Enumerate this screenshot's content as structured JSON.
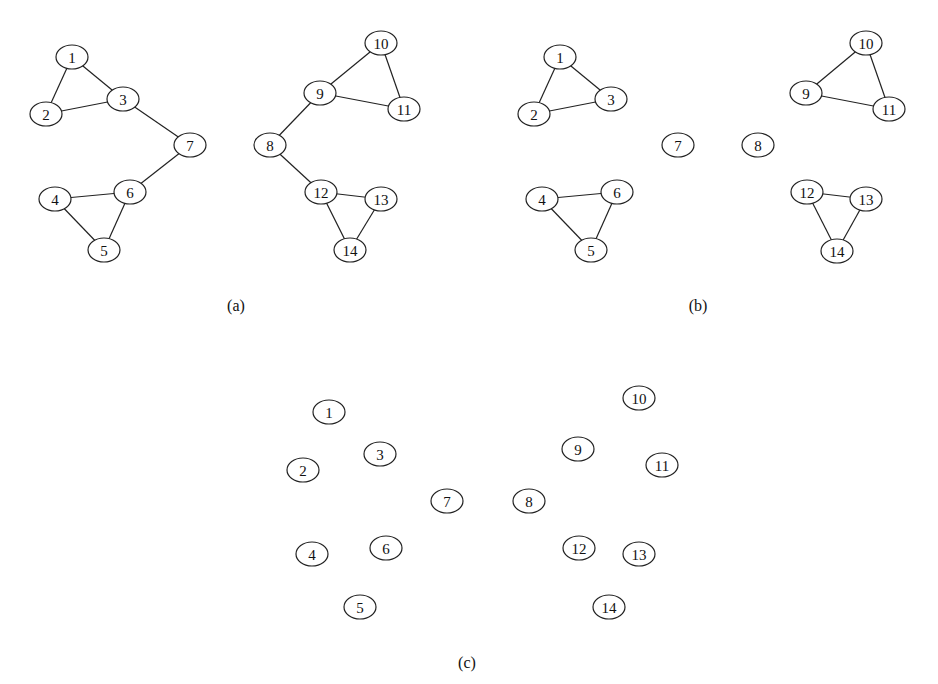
{
  "figure": {
    "node_style": {
      "rx": 16,
      "ry": 12,
      "stroke": "#222222",
      "fill": "#ffffff"
    },
    "panels": [
      {
        "label": "(a)",
        "label_pos": [
          236,
          305
        ],
        "nodes": [
          {
            "id": "1",
            "x": 72,
            "y": 57
          },
          {
            "id": "2",
            "x": 46,
            "y": 114
          },
          {
            "id": "3",
            "x": 123,
            "y": 99
          },
          {
            "id": "4",
            "x": 55,
            "y": 199
          },
          {
            "id": "5",
            "x": 104,
            "y": 250
          },
          {
            "id": "6",
            "x": 130,
            "y": 192
          },
          {
            "id": "7",
            "x": 190,
            "y": 145
          },
          {
            "id": "8",
            "x": 270,
            "y": 145
          },
          {
            "id": "9",
            "x": 320,
            "y": 93
          },
          {
            "id": "10",
            "x": 381,
            "y": 43
          },
          {
            "id": "11",
            "x": 404,
            "y": 109
          },
          {
            "id": "12",
            "x": 321,
            "y": 192
          },
          {
            "id": "13",
            "x": 381,
            "y": 199
          },
          {
            "id": "14",
            "x": 350,
            "y": 250
          }
        ],
        "edges": [
          [
            "1",
            "2"
          ],
          [
            "1",
            "3"
          ],
          [
            "2",
            "3"
          ],
          [
            "3",
            "7"
          ],
          [
            "7",
            "6"
          ],
          [
            "4",
            "6"
          ],
          [
            "4",
            "5"
          ],
          [
            "5",
            "6"
          ],
          [
            "8",
            "9"
          ],
          [
            "9",
            "10"
          ],
          [
            "9",
            "11"
          ],
          [
            "10",
            "11"
          ],
          [
            "8",
            "12"
          ],
          [
            "12",
            "13"
          ],
          [
            "12",
            "14"
          ],
          [
            "13",
            "14"
          ]
        ]
      },
      {
        "label": "(b)",
        "label_pos": [
          698,
          305
        ],
        "nodes": [
          {
            "id": "1",
            "x": 560,
            "y": 57
          },
          {
            "id": "2",
            "x": 534,
            "y": 114
          },
          {
            "id": "3",
            "x": 611,
            "y": 99
          },
          {
            "id": "4",
            "x": 542,
            "y": 199
          },
          {
            "id": "5",
            "x": 591,
            "y": 250
          },
          {
            "id": "6",
            "x": 617,
            "y": 192
          },
          {
            "id": "7",
            "x": 678,
            "y": 145
          },
          {
            "id": "8",
            "x": 758,
            "y": 145
          },
          {
            "id": "9",
            "x": 806,
            "y": 93
          },
          {
            "id": "10",
            "x": 866,
            "y": 43
          },
          {
            "id": "11",
            "x": 889,
            "y": 109
          },
          {
            "id": "12",
            "x": 807,
            "y": 192
          },
          {
            "id": "13",
            "x": 866,
            "y": 199
          },
          {
            "id": "14",
            "x": 837,
            "y": 251
          }
        ],
        "edges": [
          [
            "1",
            "2"
          ],
          [
            "1",
            "3"
          ],
          [
            "2",
            "3"
          ],
          [
            "4",
            "6"
          ],
          [
            "4",
            "5"
          ],
          [
            "5",
            "6"
          ],
          [
            "9",
            "10"
          ],
          [
            "9",
            "11"
          ],
          [
            "10",
            "11"
          ],
          [
            "12",
            "13"
          ],
          [
            "12",
            "14"
          ],
          [
            "13",
            "14"
          ]
        ]
      },
      {
        "label": "(c)",
        "label_pos": [
          467,
          662
        ],
        "nodes": [
          {
            "id": "1",
            "x": 329,
            "y": 412
          },
          {
            "id": "2",
            "x": 303,
            "y": 470
          },
          {
            "id": "3",
            "x": 380,
            "y": 454
          },
          {
            "id": "4",
            "x": 312,
            "y": 554
          },
          {
            "id": "5",
            "x": 360,
            "y": 607
          },
          {
            "id": "6",
            "x": 386,
            "y": 548
          },
          {
            "id": "7",
            "x": 447,
            "y": 501
          },
          {
            "id": "8",
            "x": 529,
            "y": 501
          },
          {
            "id": "9",
            "x": 578,
            "y": 449
          },
          {
            "id": "10",
            "x": 639,
            "y": 398
          },
          {
            "id": "11",
            "x": 662,
            "y": 465
          },
          {
            "id": "12",
            "x": 579,
            "y": 548
          },
          {
            "id": "13",
            "x": 639,
            "y": 554
          },
          {
            "id": "14",
            "x": 609,
            "y": 607
          }
        ],
        "edges": []
      }
    ]
  }
}
